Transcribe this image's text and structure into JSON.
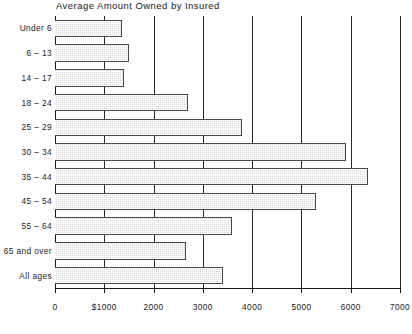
{
  "chart_data": {
    "type": "bar",
    "orientation": "horizontal",
    "title": "Average Amount Owned by Insured",
    "xlabel": "",
    "ylabel": "",
    "xlim": [
      0,
      7000
    ],
    "grid": true,
    "legend": false,
    "categories": [
      "Under 6",
      "6 – 13",
      "14 – 17",
      "18 – 24",
      "25 – 29",
      "30 – 34",
      "35 – 44",
      "45 – 54",
      "55 – 64",
      "65 and over",
      "All ages"
    ],
    "values": [
      1350,
      1500,
      1400,
      2700,
      3800,
      5900,
      6350,
      5300,
      3600,
      2650,
      3400
    ],
    "xticks": [
      0,
      1000,
      2000,
      3000,
      4000,
      5000,
      6000,
      7000
    ],
    "xtick_labels": [
      "0",
      "$1000",
      "2000",
      "3000",
      "4000",
      "5000",
      "6000",
      "7000"
    ],
    "bar_fill_color": "#d9d9d9",
    "bar_border_color": "#4a4a4a",
    "gridline_color": "#2a2a2a",
    "background_color": "#ffffff"
  }
}
